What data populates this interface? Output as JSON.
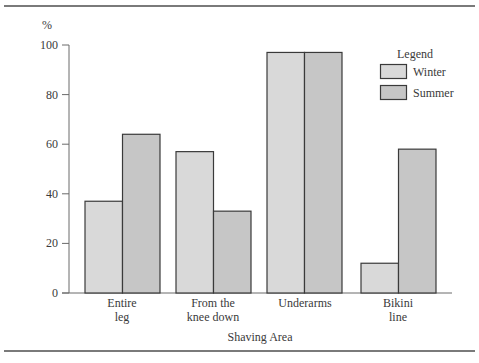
{
  "chart_data": {
    "type": "bar",
    "title": "",
    "xlabel": "Shaving Area",
    "ylabel": "%",
    "ylim": [
      0,
      100
    ],
    "yticks": [
      0,
      20,
      40,
      60,
      80,
      100
    ],
    "grid": false,
    "legend_position": "top-right",
    "legend_title": "Legend",
    "categories": [
      {
        "line1": "Entire",
        "line2": "leg"
      },
      {
        "line1": "From the",
        "line2": "knee down"
      },
      {
        "line1": "Underarms",
        "line2": ""
      },
      {
        "line1": "Bikini",
        "line2": "line"
      }
    ],
    "series": [
      {
        "name": "Winter",
        "color": "#d9d9d9",
        "values": [
          37,
          57,
          97,
          12
        ]
      },
      {
        "name": "Summer",
        "color": "#c6c6c6",
        "values": [
          64,
          33,
          97,
          58
        ]
      }
    ]
  },
  "labels": {
    "y_unit": "%",
    "x_title": "Shaving Area",
    "legend_title": "Legend",
    "legend_winter": "Winter",
    "legend_summer": "Summer",
    "tick_0": "0",
    "tick_20": "20",
    "tick_40": "40",
    "tick_60": "60",
    "tick_80": "80",
    "tick_100": "100",
    "cat0_l1": "Entire",
    "cat0_l2": "leg",
    "cat1_l1": "From the",
    "cat1_l2": "knee down",
    "cat2_l1": "Underarms",
    "cat3_l1": "Bikini",
    "cat3_l2": "line"
  }
}
